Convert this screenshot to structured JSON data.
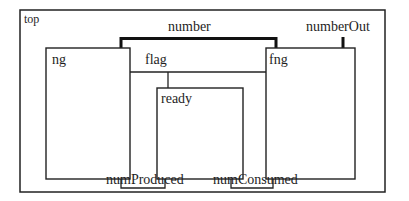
{
  "diagram": {
    "container": {
      "label": "top"
    },
    "blocks": [
      {
        "id": "ng",
        "label": "ng"
      },
      {
        "id": "fng",
        "label": "fng"
      },
      {
        "id": "ready",
        "label": "ready"
      }
    ],
    "signals": [
      {
        "id": "number",
        "label": "number",
        "from": "ng",
        "to": "fng",
        "style": "thick"
      },
      {
        "id": "numberOut",
        "label": "numberOut",
        "from": "fng",
        "to": "top",
        "style": "thick"
      },
      {
        "id": "flag",
        "label": "flag",
        "from": "ng",
        "to": [
          "fng",
          "ready"
        ],
        "style": "thin"
      },
      {
        "id": "numProduced",
        "label": "numProduced",
        "from": "ng",
        "to": "ready",
        "style": "thin"
      },
      {
        "id": "numConsumed",
        "label": "numConsumed",
        "from": "ready",
        "to": "fng",
        "style": "thin"
      }
    ]
  },
  "colors": {
    "stroke": "#222222",
    "background": "#ffffff"
  }
}
